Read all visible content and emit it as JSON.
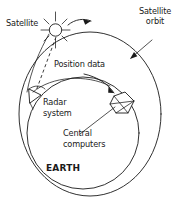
{
  "diagram": {
    "background_color": "#ffffff",
    "line_color": "#1a1a1a",
    "labels": {
      "satellite": "Satellite",
      "satellite_orbit_line1": "Satellite",
      "satellite_orbit_line2": "orbit",
      "position_data": "Position data",
      "radar_line1": "Radar",
      "radar_line2": "system",
      "central_line1": "Central",
      "central_line2": "computers",
      "earth": "EARTH"
    },
    "icons": {
      "satellite": "satellite-star-icon",
      "radar": "radar-dish-icon",
      "computers": "central-computers-icon",
      "orbit_direction_arrow": "orbit-direction-arrow-icon",
      "position_data_arrow": "position-data-arrow-icon",
      "orbit_leader_arrow": "orbit-leader-arrow-icon",
      "downlink": "downlink-dashed-line-icon"
    }
  }
}
